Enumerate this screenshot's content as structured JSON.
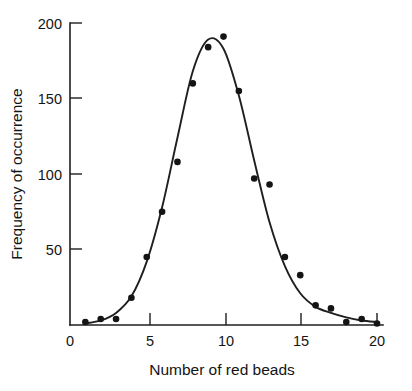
{
  "chart_data": {
    "type": "scatter",
    "title": "",
    "subtitle": "",
    "xlabel": "Number of red beads",
    "ylabel": "Frequency of occurrence",
    "xlim": [
      0,
      20.6
    ],
    "ylim": [
      0,
      200
    ],
    "grid": false,
    "legend": null,
    "x_ticks": [
      0,
      5,
      10,
      15,
      20
    ],
    "x_tick_labels": [
      "0",
      "5",
      "10",
      "15",
      "20"
    ],
    "y_ticks": [
      50,
      100,
      150,
      200
    ],
    "y_tick_labels": [
      "50",
      "100",
      "150",
      "200"
    ],
    "x": [
      1,
      2,
      3,
      4,
      5,
      6,
      7,
      8,
      9,
      10,
      11,
      12,
      13,
      14,
      15,
      16,
      17,
      18,
      19,
      20
    ],
    "values": [
      2,
      4,
      4,
      18,
      45,
      75,
      108,
      160,
      184,
      191,
      155,
      97,
      93,
      45,
      33,
      13,
      11,
      2,
      4,
      1
    ],
    "series": [
      {
        "name": "observed frequency",
        "type": "scatter",
        "marker": "filled-circle",
        "color": "#141414",
        "x": [
          1,
          2,
          3,
          4,
          5,
          6,
          7,
          8,
          9,
          10,
          11,
          12,
          13,
          14,
          15,
          16,
          17,
          18,
          19,
          20
        ],
        "values": [
          2,
          4,
          4,
          18,
          45,
          75,
          108,
          160,
          184,
          191,
          155,
          97,
          93,
          45,
          33,
          13,
          11,
          2,
          4,
          1
        ]
      },
      {
        "name": "fitted binomial curve",
        "type": "line",
        "color": "#1f1f1f",
        "x": [
          1,
          2,
          3,
          4,
          5,
          6,
          7,
          8,
          9,
          10,
          11,
          12,
          13,
          14,
          15,
          16,
          17,
          18,
          19,
          20
        ],
        "values": [
          1,
          3,
          8,
          19,
          42,
          78,
          124,
          168,
          189,
          183,
          152,
          109,
          68,
          39,
          21,
          12,
          8,
          5,
          3,
          2
        ]
      }
    ],
    "annotations": []
  },
  "axes": {
    "y_title": "Frequency of occurrence",
    "x_title": "Number of red beads"
  },
  "colors": {
    "ink": "#141414",
    "axis": "#1f1f1f",
    "background": "#ffffff"
  }
}
